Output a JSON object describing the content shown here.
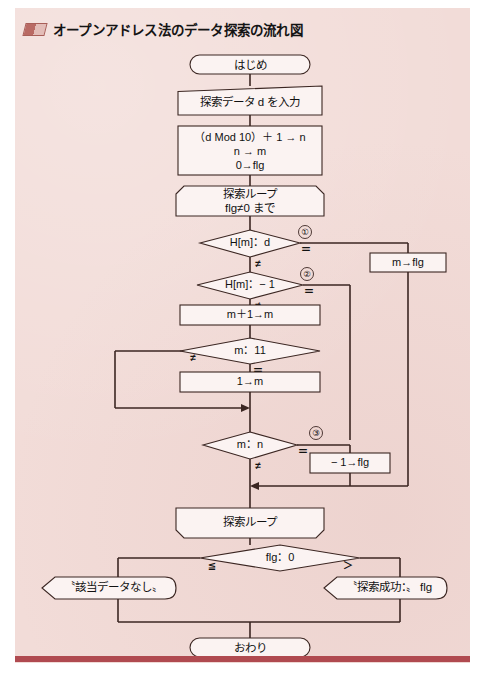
{
  "title": {
    "text": "オープンアドレス法のデータ探索の流れ図",
    "marker_icon": "title-block-icon",
    "accent_color": "#b04a50"
  },
  "page": {
    "background_color": "#ffffff",
    "paper_color": "#f2dcd8",
    "ink_color": "#3b2622",
    "shape_fill": "#fbf3f2"
  },
  "flowchart": {
    "type": "flowchart",
    "nodes": [
      {
        "id": "start",
        "shape": "terminator",
        "label": "はじめ"
      },
      {
        "id": "input_d",
        "shape": "manual-input",
        "label": "探索データ d を入力"
      },
      {
        "id": "init",
        "shape": "process",
        "label_line1": "（d  Mod 10）＋ 1 → n",
        "label_line2": "n → m",
        "label_line3": "0→flg"
      },
      {
        "id": "loop_start",
        "shape": "loop-start",
        "label_line1": "探索ループ",
        "label_line2": "flg≠0 まで"
      },
      {
        "id": "cond1",
        "shape": "decision",
        "label": "H[m]：d",
        "marker": "①",
        "branch_right": "＝",
        "branch_down": "≠"
      },
      {
        "id": "set_m_flg",
        "shape": "process",
        "label": "m→flg"
      },
      {
        "id": "cond2",
        "shape": "decision",
        "label": "H[m]：− 1",
        "marker": "②",
        "branch_right": "＝",
        "branch_down": "≠"
      },
      {
        "id": "incr_m",
        "shape": "process",
        "label": "m＋1→m"
      },
      {
        "id": "cond3",
        "shape": "decision",
        "label": "m：11",
        "branch_left": "≠",
        "branch_down": "＝"
      },
      {
        "id": "reset_m",
        "shape": "process",
        "label": "1→m"
      },
      {
        "id": "cond4",
        "shape": "decision",
        "label": "m：n",
        "marker": "③",
        "branch_right": "＝",
        "branch_down": "≠"
      },
      {
        "id": "set_neg_flg",
        "shape": "process",
        "label": "− 1→flg"
      },
      {
        "id": "loop_end",
        "shape": "loop-end",
        "label": "探索ループ"
      },
      {
        "id": "cond5",
        "shape": "decision",
        "label": "flg：0",
        "branch_left": "≦",
        "branch_right": "＞"
      },
      {
        "id": "out_fail",
        "shape": "display",
        "label": "〝該当データなし〟"
      },
      {
        "id": "out_ok",
        "shape": "display",
        "label": "〝探索成功：〟 flg"
      },
      {
        "id": "end",
        "shape": "terminator",
        "label": "おわり"
      }
    ]
  }
}
